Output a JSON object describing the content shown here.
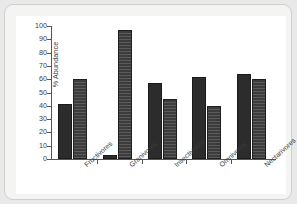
{
  "chart_data": {
    "type": "bar",
    "title": "",
    "xlabel": "",
    "ylabel": "% Abundance",
    "ylim": [
      0,
      100
    ],
    "ytick_step": 10,
    "grid": false,
    "legend": "none",
    "categories": [
      "Fructivores",
      "Granivores",
      "Insectivores",
      "Omnivores",
      "Nectarivores"
    ],
    "yticks": [
      "100",
      "90",
      "80",
      "70",
      "60",
      "50",
      "40",
      "30",
      "20",
      "10",
      "0"
    ],
    "ytick_values": [
      100,
      90,
      80,
      70,
      60,
      50,
      40,
      30,
      20,
      10,
      0
    ],
    "series": [
      {
        "name": "series-1",
        "color": "#2c2c2c",
        "fill": "solid",
        "values": [
          41,
          3,
          57,
          62,
          64
        ]
      },
      {
        "name": "series-2",
        "color": "#3c3c3c",
        "fill": "horizontal-hatch",
        "values": [
          60,
          97,
          45,
          40,
          60
        ]
      }
    ]
  },
  "figure": {
    "axis_color": "#555555",
    "panel_background": "#ffffff",
    "card_background": "#f4f4f3",
    "card_border": "#cfcfcf",
    "backdrop": "#e9e9e9"
  }
}
